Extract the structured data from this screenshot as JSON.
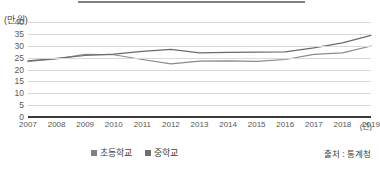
{
  "figure": {
    "top_rule": true,
    "unit_label": "(만 원)",
    "source_note": "출처 : 통계청"
  },
  "legend": {
    "position": "bottom-center",
    "items": [
      {
        "label": "초등학교",
        "color": "#808080"
      },
      {
        "label": "중학교",
        "color": "#6e6e6e"
      }
    ]
  },
  "chart_data": {
    "type": "line",
    "title": "",
    "subtitle": "",
    "xlabel": "(년)",
    "ylabel": "(만 원)",
    "ylim": [
      0,
      40
    ],
    "ytick_values": [
      0,
      5,
      10,
      15,
      20,
      25,
      30,
      35,
      40
    ],
    "ytick_labels": [
      "0",
      "5",
      "10",
      "15",
      "20",
      "25",
      "30",
      "35",
      "40"
    ],
    "grid": true,
    "grid_axis": "y",
    "legend_position": "bottom-center",
    "annotations": [
      "출처 : 통계청"
    ],
    "categories": [
      2007,
      2008,
      2009,
      2010,
      2011,
      2012,
      2013,
      2014,
      2015,
      2016,
      2017,
      2018,
      2019
    ],
    "xtick_labels": [
      "2007",
      "2008",
      "2009",
      "2010",
      "2011",
      "2012",
      "2013",
      "2014",
      "2015",
      "2016",
      "2017",
      "2018",
      "2019"
    ],
    "series": [
      {
        "name": "초등학교",
        "color": "#8a8a8a",
        "values": [
          23.4,
          24.5,
          26.4,
          26.2,
          24.2,
          22.4,
          23.5,
          23.6,
          23.4,
          24.2,
          26.4,
          27.0,
          29.9
        ]
      },
      {
        "name": "중학교",
        "color": "#6b6b6b",
        "values": [
          23.6,
          24.7,
          25.9,
          26.5,
          27.6,
          28.5,
          27.0,
          27.2,
          27.3,
          27.4,
          29.1,
          31.2,
          34.4
        ]
      }
    ]
  }
}
